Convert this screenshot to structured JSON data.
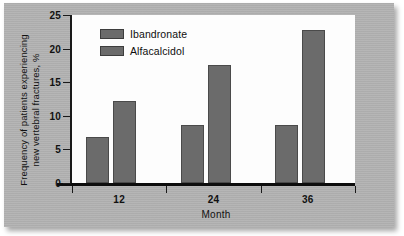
{
  "chart_data": {
    "type": "bar",
    "title": "",
    "xlabel": "Month",
    "ylabel": "Frequency of patients experiencing new vertebral fractures, %",
    "ylabel_lines": [
      "Frequency of patients experiencing",
      "new vertebral fractures, %"
    ],
    "categories": [
      "12",
      "24",
      "36"
    ],
    "series": [
      {
        "name": "Ibandronate",
        "values": [
          6.8,
          8.7,
          8.7
        ],
        "color": "#6b6b6b"
      },
      {
        "name": "Alfacalcidol",
        "values": [
          12.2,
          17.6,
          22.8
        ],
        "color": "#6b6b6b"
      }
    ],
    "ylim": [
      0,
      25
    ],
    "yticks": [
      0,
      5,
      10,
      15,
      20,
      25
    ],
    "ytick_labels": [
      "0",
      "5",
      "10",
      "15",
      "20",
      "25"
    ],
    "grid": false,
    "legend_position": "top-left"
  },
  "legend": {
    "items": [
      {
        "label": "Ibandronate"
      },
      {
        "label": "Alfacalcidol"
      }
    ]
  },
  "axes": {
    "x_title": "Month",
    "y_title_line1": "Frequency of patients experiencing",
    "y_title_line2": "new vertebral fractures, %"
  },
  "style": {
    "mat_color": "#b2b2b2",
    "plot_background": "#fdfdfd",
    "bar_color": "#6b6b6b",
    "bar_border": "#4a4a4a",
    "axis_color": "#111111"
  }
}
